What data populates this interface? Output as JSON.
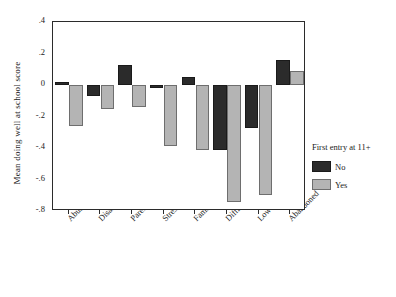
{
  "chart_data": {
    "type": "bar",
    "title": "",
    "subtitle": "",
    "xlabel": "",
    "ylabel": "Mean doing well at school score",
    "ylim": [
      -0.8,
      0.4
    ],
    "yticks": [
      ".4",
      ".2",
      "0",
      "-.2",
      "-.4",
      "-.6",
      "-.8"
    ],
    "ytick_values": [
      0.4,
      0.2,
      0.0,
      -0.2,
      -0.4,
      -0.6,
      -0.8
    ],
    "grid": false,
    "legend_position": "right",
    "legend_title": "First entry at 11+",
    "categories": [
      "Abuse or neglect",
      "Disabled",
      "Parent disabled",
      "Stress",
      "Family dysfunction",
      "Difficult behaviour",
      "Low income",
      "Abandoned"
    ],
    "series": [
      {
        "name": "No",
        "color": "#2b2b2b",
        "values": [
          0.02,
          -0.07,
          0.13,
          -0.02,
          0.05,
          -0.41,
          -0.275,
          0.16
        ]
      },
      {
        "name": "Yes",
        "color": "#b4b4b4",
        "values": [
          -0.26,
          -0.155,
          -0.14,
          -0.39,
          -0.41,
          -0.74,
          -0.7,
          0.09
        ]
      }
    ]
  },
  "legend": {
    "title": "First entry at 11+",
    "entries": [
      {
        "label": "No",
        "color": "#2b2b2b"
      },
      {
        "label": "Yes",
        "color": "#b4b4b4"
      }
    ]
  },
  "axes": {
    "y_title": "Mean doing well at school score"
  }
}
